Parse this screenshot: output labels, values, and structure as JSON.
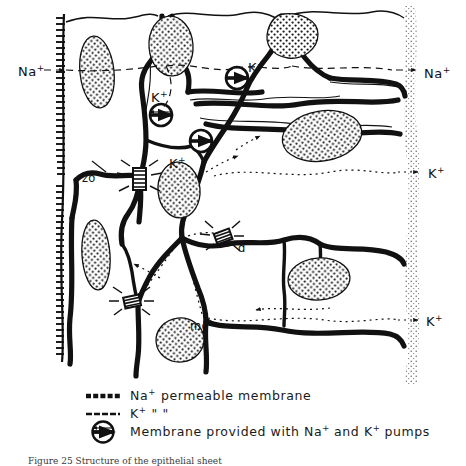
{
  "figure": {
    "domain": "scientific-diagram",
    "background_color": "#ffffff",
    "ink_color": "#111111"
  },
  "ion_labels": {
    "left": [
      {
        "id": "na-left",
        "text": "Na",
        "charge": "+",
        "x": 20,
        "y": 74,
        "arrow": "right-dashed"
      }
    ],
    "interior": [
      {
        "id": "k-interior-top",
        "text": "K",
        "charge": "+",
        "x": 245,
        "y": 70
      },
      {
        "id": "k-interior-left",
        "text": "K",
        "charge": "+",
        "x": 150,
        "y": 100
      },
      {
        "id": "k-interior-middle",
        "text": "K",
        "charge": "+",
        "x": 167,
        "y": 166
      }
    ],
    "right": [
      {
        "id": "na-right",
        "text": "Na",
        "charge": "+",
        "x": 428,
        "y": 74,
        "arrow": "right-dashed"
      },
      {
        "id": "k-right-mid",
        "text": "K",
        "charge": "+",
        "x": 430,
        "y": 182,
        "arrow": "right-dotted"
      },
      {
        "id": "k-right-bot",
        "text": "K",
        "charge": "+",
        "x": 428,
        "y": 315,
        "arrow": "right-dotted"
      }
    ]
  },
  "structure_labels": [
    {
      "id": "zo",
      "text": "zo",
      "x": 84,
      "y": 178,
      "meaning": "zonula occludens"
    },
    {
      "id": "d",
      "text": "d",
      "x": 236,
      "y": 248,
      "meaning": "desmosome"
    },
    {
      "id": "mo",
      "text": "mo",
      "x": 192,
      "y": 326,
      "meaning": "macula occludens"
    }
  ],
  "legend": {
    "rows": [
      {
        "id": "legend-na",
        "symbol": "thick-dashed-line",
        "label_main": "Na",
        "label_sup": "+",
        "label_rest": "permeable membrane"
      },
      {
        "id": "legend-k",
        "symbol": "thin-line",
        "label_main": "K",
        "label_sup": "+",
        "label_rest": "\"                 \""
      },
      {
        "id": "legend-pump",
        "symbol": "circle-with-bar",
        "label_prefix": "Membrane provided with Na",
        "label_sup1": "+",
        "label_mid": "and K",
        "label_sup2": "+",
        "label_suffix": "pumps"
      }
    ]
  },
  "caption": {
    "text": "Figure 25 Structure of the epithelial sheet",
    "visible": "partially-cropped"
  },
  "colors": {
    "ink": "#111111",
    "stipple": "#222222",
    "basal_lamina": "#8a8a8a"
  }
}
